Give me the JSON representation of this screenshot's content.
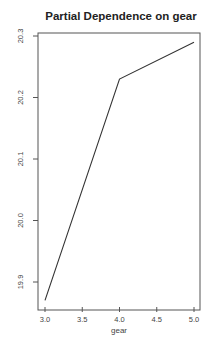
{
  "chart_data": {
    "type": "line",
    "title": "Partial Dependence on gear",
    "xlabel": "gear",
    "ylabel": "",
    "x": [
      3.0,
      4.0,
      5.0
    ],
    "values": [
      19.87,
      20.23,
      20.29
    ],
    "series": [
      {
        "name": "partial dependence",
        "x": [
          3.0,
          4.0,
          5.0
        ],
        "values": [
          19.87,
          20.23,
          20.29
        ]
      }
    ],
    "xlim": [
      2.95,
      5.08
    ],
    "ylim": [
      19.85,
      20.305
    ],
    "xticks": [
      3.0,
      3.5,
      4.0,
      4.5,
      5.0
    ],
    "xtick_labels": [
      "3.0",
      "3.5",
      "4.0",
      "4.5",
      "5.0"
    ],
    "yticks": [
      19.9,
      20.0,
      20.1,
      20.2,
      20.3
    ],
    "ytick_labels": [
      "19.9",
      "20.0",
      "20.1",
      "20.2",
      "20.3"
    ],
    "grid": false,
    "legend": "none",
    "line_color": "#333333"
  }
}
